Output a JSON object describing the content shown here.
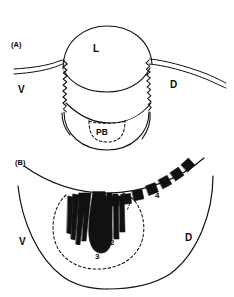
{
  "figure": {
    "ink_color": "#111111",
    "background_color": "#ffffff"
  },
  "panel_a": {
    "tag": "(A)",
    "labels": {
      "lumen": "L",
      "ventral": "V",
      "dorsal": "D",
      "photophore_bulb": "PB"
    }
  },
  "panel_b": {
    "tag": "(B)",
    "labels": {
      "ventral": "V",
      "dorsal": "D"
    },
    "structures": [
      {
        "id": "1",
        "label": "1",
        "kind": "striated-band-group-left"
      },
      {
        "id": "2",
        "label": "2",
        "kind": "striated-band-group-right"
      },
      {
        "id": "3",
        "label": "3",
        "kind": "central-teardrop-body"
      },
      {
        "id": "4a",
        "label": "4",
        "kind": "block-inner"
      },
      {
        "id": "4b",
        "label": "4",
        "kind": "block-arc-outer"
      }
    ]
  }
}
